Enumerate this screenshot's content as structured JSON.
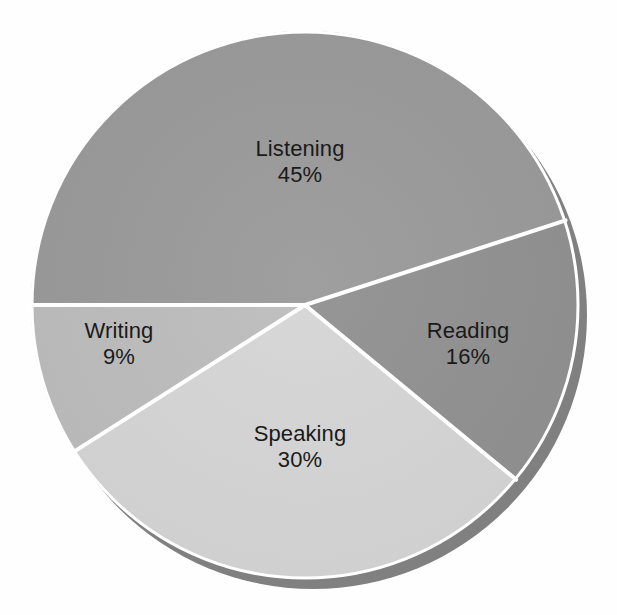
{
  "chart_data": {
    "type": "pie",
    "title": "",
    "categories": [
      "Listening",
      "Reading",
      "Speaking",
      "Writing"
    ],
    "values": [
      45,
      16,
      30,
      9
    ],
    "value_unit": "%",
    "legend": "none",
    "grid": false,
    "slices": [
      {
        "label": "Listening",
        "value": 45,
        "value_text": "45%",
        "color": "#9a9a9a",
        "start_angle_deg": 180,
        "sweep_deg": 162
      },
      {
        "label": "Reading",
        "value": 16,
        "value_text": "16%",
        "color": "#919191",
        "start_angle_deg": 342,
        "sweep_deg": 57.6
      },
      {
        "label": "Speaking",
        "value": 30,
        "value_text": "30%",
        "color": "#d6d6d6",
        "start_angle_deg": 39.6,
        "sweep_deg": 108
      },
      {
        "label": "Writing",
        "value": 9,
        "value_text": "9%",
        "color": "#bdbdbd",
        "start_angle_deg": 147.6,
        "sweep_deg": 32.4
      }
    ]
  },
  "style": {
    "background": "#fefefe",
    "separator_color": "#ffffff",
    "separator_width": 4,
    "shadow_color": "#808080",
    "label_color": "#1a1a1a",
    "center_x": 305,
    "center_y": 305,
    "radius": 274
  },
  "labels": {
    "listening": {
      "name": "Listening",
      "pct": "45%"
    },
    "reading": {
      "name": "Reading",
      "pct": "16%"
    },
    "speaking": {
      "name": "Speaking",
      "pct": "30%"
    },
    "writing": {
      "name": "Writing",
      "pct": "9%"
    }
  }
}
